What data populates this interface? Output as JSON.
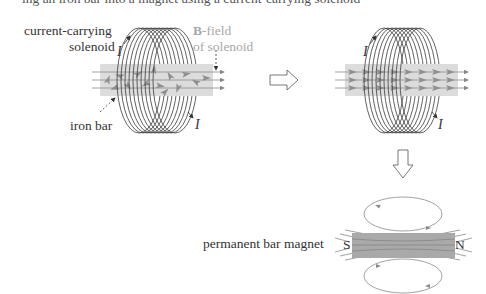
{
  "top_fragment": "ing an iron bar into a magnet using a current-carrying solenoid",
  "panel_left": {
    "label_solenoid_line1": "current-carrying",
    "label_solenoid_line2": "solenoid",
    "label_bfield_bold": "B",
    "label_bfield_rest": "-field",
    "label_bfield_line2": "of solenoid",
    "label_iron_bar": "iron bar",
    "current_top": "I",
    "current_bottom": "I"
  },
  "panel_right": {
    "current_top": "I",
    "current_bottom": "I"
  },
  "transition_arrow_right": "right-arrow",
  "transition_arrow_down": "down-arrow",
  "panel_magnet": {
    "label": "permanent bar magnet",
    "pole_south": "S",
    "pole_north": "N"
  },
  "colors": {
    "coil": "#3a3a3a",
    "bar_fill": "#d9d9d9",
    "domain_arrow": "#8f8f8f",
    "field_line": "#8a8a8a",
    "label_gray": "#a8a8a8",
    "magnet_fill": "#a9a9a9"
  }
}
